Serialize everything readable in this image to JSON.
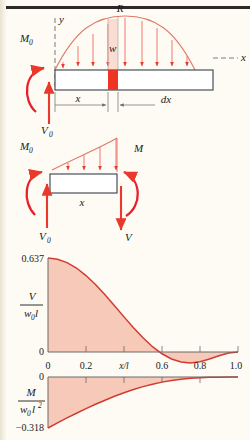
{
  "figure": {
    "title_rule": true,
    "colors": {
      "curve": "#d23b30",
      "fill": "#f7c9b8",
      "arrow": "#e8392c",
      "moment_arrow": "#e8202a",
      "beam_outline": "#3a3f4a",
      "axis": "#6b6b6b",
      "page_bg": "#fdfbf4",
      "text": "#1a1a1a"
    }
  },
  "diagram_top": {
    "name": "sinusoidal-distributed-load-beam",
    "labels": {
      "resultant": "R",
      "load_intensity": "w",
      "y_axis": "y",
      "x_axis": "x",
      "moment_reaction": "M",
      "moment_reaction_sub": "0",
      "shear_reaction": "V",
      "shear_reaction_sub": "0",
      "dim_x": "x",
      "dim_dx": "dx"
    },
    "load_arrow_count": 9
  },
  "diagram_mid": {
    "name": "free-body-diagram-segment",
    "labels": {
      "moment_left": "M",
      "moment_left_sub": "0",
      "shear_left": "V",
      "shear_left_sub": "0",
      "moment_right": "M",
      "shear_right": "V",
      "dim_x": "x"
    },
    "load_arrow_count": 4
  },
  "chart_data": [
    {
      "type": "area",
      "name": "shear-diagram",
      "ylabel_num": "V",
      "ylabel_den": "w",
      "ylabel_den_sub": "0",
      "ylabel_den_tail": "l",
      "ytick_top": "0.637",
      "ytick_bottom": "0",
      "ylim": [
        0,
        0.637
      ],
      "xlim": [
        0,
        1.0
      ],
      "xlabel": "x/l",
      "xticks": [
        "0",
        "0.2",
        "0.6",
        "0.8",
        "1.0"
      ],
      "xtick_values": [
        0,
        0.2,
        0.6,
        0.8,
        1.0
      ],
      "grid": false,
      "x": [
        0.0,
        0.05,
        0.1,
        0.15,
        0.2,
        0.25,
        0.3,
        0.35,
        0.4,
        0.45,
        0.5,
        0.55,
        0.6,
        0.65,
        0.7,
        0.75,
        0.8,
        0.85,
        0.9,
        0.95,
        1.0
      ],
      "values": [
        0.637,
        0.629,
        0.606,
        0.569,
        0.518,
        0.457,
        0.388,
        0.314,
        0.238,
        0.165,
        0.096,
        0.036,
        -0.012,
        -0.047,
        -0.068,
        -0.074,
        -0.066,
        -0.047,
        -0.025,
        -0.007,
        0.0
      ]
    },
    {
      "type": "area",
      "name": "moment-diagram",
      "ylabel_num": "M",
      "ylabel_den": "w",
      "ylabel_den_sub": "0",
      "ylabel_den_tail": "l",
      "ylabel_den_exp": "2",
      "ytick_top": "0",
      "ytick_bottom": "−0.318",
      "ylim": [
        -0.318,
        0
      ],
      "xlim": [
        0,
        1.0
      ],
      "grid": false,
      "x": [
        0.0,
        0.05,
        0.1,
        0.15,
        0.2,
        0.25,
        0.3,
        0.35,
        0.4,
        0.45,
        0.5,
        0.55,
        0.6,
        0.65,
        0.7,
        0.75,
        0.8,
        0.85,
        0.9,
        0.95,
        1.0
      ],
      "values": [
        -0.318,
        -0.286,
        -0.255,
        -0.226,
        -0.197,
        -0.17,
        -0.145,
        -0.12,
        -0.098,
        -0.078,
        -0.06,
        -0.045,
        -0.032,
        -0.022,
        -0.014,
        -0.008,
        -0.004,
        -0.002,
        -0.001,
        0.0,
        0.0
      ]
    }
  ]
}
